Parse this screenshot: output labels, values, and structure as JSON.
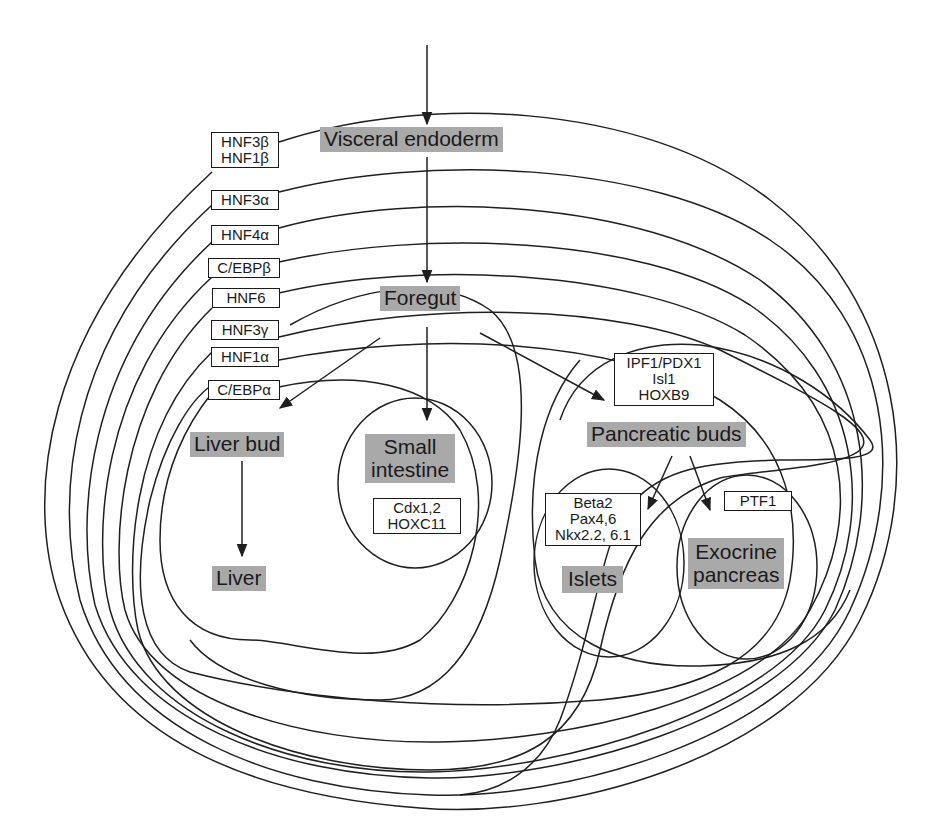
{
  "colors": {
    "stage_fill": "#a9a9a9",
    "line": "#1f1f1f",
    "text": "#1a1a1a",
    "background": "#ffffff"
  },
  "stages": {
    "visceral_endoderm": "Visceral endoderm",
    "foregut": "Foregut",
    "liver_bud": "Liver bud",
    "liver": "Liver",
    "small_intestine_1": "Small",
    "small_intestine_2": "intestine",
    "pancreatic_buds": "Pancreatic buds",
    "islets": "Islets",
    "exocrine_1": "Exocrine",
    "exocrine_2": "pancreas"
  },
  "transcription_factors": {
    "left_column": [
      {
        "lines": [
          "HNF3β",
          "HNF1β"
        ]
      },
      {
        "lines": [
          "HNF3α"
        ]
      },
      {
        "lines": [
          "HNF4α"
        ]
      },
      {
        "lines": [
          "C/EBPβ"
        ]
      },
      {
        "lines": [
          "HNF6"
        ]
      },
      {
        "lines": [
          "HNF3γ"
        ]
      },
      {
        "lines": [
          "HNF1α"
        ]
      },
      {
        "lines": [
          "C/EBPα"
        ]
      }
    ],
    "intestine": [
      "Cdx1,2",
      "HOXC11"
    ],
    "pancreatic_buds": [
      "IPF1/PDX1",
      "Isl1",
      "HOXB9"
    ],
    "islets": [
      "Beta2",
      "Pax4,6",
      "Nkx2.2, 6.1"
    ],
    "exocrine": [
      "PTF1"
    ]
  },
  "relations": [
    {
      "from": "input",
      "to": "Visceral endoderm"
    },
    {
      "from": "Visceral endoderm",
      "to": "Foregut"
    },
    {
      "from": "Foregut",
      "to": "Liver bud"
    },
    {
      "from": "Foregut",
      "to": "Small intestine"
    },
    {
      "from": "Foregut",
      "to": "Pancreatic buds"
    },
    {
      "from": "Liver bud",
      "to": "Liver"
    },
    {
      "from": "Pancreatic buds",
      "to": "Islets"
    },
    {
      "from": "Pancreatic buds",
      "to": "Exocrine pancreas"
    }
  ]
}
